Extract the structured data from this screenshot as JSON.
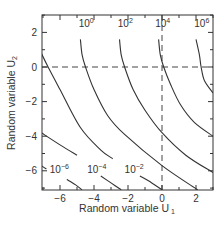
{
  "chart_data": {
    "type": "line",
    "subtype": "contour",
    "title": "",
    "xlabel": "Random variable U",
    "xlabel_sub": "1",
    "ylabel": "Random variable U",
    "ylabel_sub": "2",
    "xlim": [
      -7.1,
      3.0
    ],
    "ylim": [
      -7.1,
      3.0
    ],
    "xticks": [
      -6,
      -4,
      -2,
      0,
      2
    ],
    "yticks": [
      -6,
      -4,
      -2,
      0,
      2
    ],
    "minor_step": 1,
    "grid": false,
    "legend": null,
    "reference_lines": [
      {
        "orientation": "horizontal",
        "value": 0,
        "style": "dashed"
      },
      {
        "orientation": "vertical",
        "value": 0,
        "style": "dashed"
      }
    ],
    "series": [
      {
        "name": "10^6",
        "base": "10",
        "exp": "6",
        "label_pos": [
          1.9,
          2.3
        ],
        "points": [
          [
            2.0,
            1.6
          ],
          [
            2.2,
            0.7
          ],
          [
            2.3,
            0
          ],
          [
            2.5,
            -0.8
          ],
          [
            3.0,
            -1.5
          ]
        ]
      },
      {
        "name": "10^4",
        "base": "10",
        "exp": "4",
        "label_pos": [
          -0.4,
          2.3
        ],
        "points": [
          [
            -0.2,
            1.6
          ],
          [
            -0.1,
            0.7
          ],
          [
            0.1,
            0
          ],
          [
            0.5,
            -1.0
          ],
          [
            1.1,
            -2.2
          ],
          [
            1.9,
            -3.2
          ],
          [
            3.0,
            -4.0
          ]
        ]
      },
      {
        "name": "10^2",
        "base": "10",
        "exp": "2",
        "label_pos": [
          -2.6,
          2.3
        ],
        "points": [
          [
            -2.5,
            1.6
          ],
          [
            -2.4,
            0.7
          ],
          [
            -2.2,
            0
          ],
          [
            -1.7,
            -1.3
          ],
          [
            -1.0,
            -2.5
          ],
          [
            0,
            -3.8
          ],
          [
            1.4,
            -5.1
          ],
          [
            3.0,
            -6.1
          ]
        ]
      },
      {
        "name": "10^0",
        "base": "10",
        "exp": "0",
        "label_pos": [
          -4.9,
          2.3
        ],
        "points": [
          [
            -4.8,
            1.6
          ],
          [
            -4.7,
            0.7
          ],
          [
            -4.5,
            0
          ],
          [
            -4.0,
            -1.3
          ],
          [
            -3.2,
            -2.8
          ],
          [
            -2.2,
            -3.9
          ],
          [
            0,
            -5.7
          ],
          [
            2.1,
            -7.1
          ]
        ]
      },
      {
        "name": "10^-2",
        "base": "10",
        "exp": "-2",
        "label_pos": [
          -2.2,
          -6.1
        ],
        "points": [
          [
            -7.1,
            0.8
          ],
          [
            -6.7,
            0
          ],
          [
            -6.0,
            -1.3
          ],
          [
            -4.8,
            -3.5
          ],
          [
            -3.6,
            -4.8
          ],
          [
            -2.9,
            -5.3
          ]
        ],
        "tail": [
          [
            -1.3,
            -6.3
          ],
          [
            -0.6,
            -6.7
          ],
          [
            0,
            -7.1
          ]
        ]
      },
      {
        "name": "10^-4",
        "base": "10",
        "exp": "-4",
        "label_pos": [
          -4.4,
          -6.1
        ],
        "points": [
          [
            -7.1,
            -3.8
          ],
          [
            -6.0,
            -4.5
          ],
          [
            -5.0,
            -5.1
          ]
        ],
        "tail": [
          [
            -3.6,
            -6.3
          ],
          [
            -3.0,
            -6.7
          ],
          [
            -2.4,
            -7.1
          ]
        ]
      },
      {
        "name": "10^-6",
        "base": "10",
        "exp": "-6",
        "label_pos": [
          -6.6,
          -6.1
        ],
        "points": [
          [
            -7.1,
            -5.7
          ],
          [
            -6.8,
            -5.9
          ]
        ],
        "tail": [
          [
            -5.6,
            -6.5
          ],
          [
            -5.1,
            -6.8
          ],
          [
            -4.7,
            -7.1
          ]
        ]
      }
    ]
  }
}
